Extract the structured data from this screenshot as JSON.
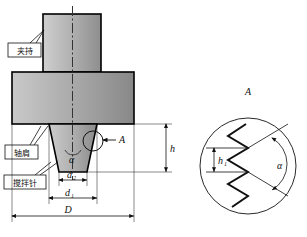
{
  "figure": {
    "title": "",
    "type": "engineering-cross-section-diagram"
  },
  "colors": {
    "outline": "#000000",
    "metal_light": "#d8d8d8",
    "metal_dark": "#8c8c8c",
    "centerline": "#333333",
    "dimension": "#111111",
    "background": "#ffffff"
  },
  "left_view": {
    "name": "tool-cross-section",
    "callout_labels": [
      {
        "id": "clamp",
        "text": "夹持",
        "meaning": "clamping-shank"
      },
      {
        "id": "shoulder",
        "text": "轴肩",
        "meaning": "shoulder"
      },
      {
        "id": "pin",
        "text": "搅拌针",
        "meaning": "stirring-pin"
      }
    ],
    "dimensions": [
      {
        "id": "d2",
        "symbol": "d",
        "subscript": "2",
        "meaning": "pin-tip-diameter"
      },
      {
        "id": "d1",
        "symbol": "d",
        "subscript": "1",
        "meaning": "pin-root-diameter"
      },
      {
        "id": "D",
        "symbol": "D",
        "subscript": "",
        "meaning": "shoulder-diameter"
      },
      {
        "id": "h",
        "symbol": "h",
        "subscript": "",
        "meaning": "pin-length"
      },
      {
        "id": "alpha",
        "symbol": "α",
        "subscript": "",
        "meaning": "pin-taper-angle"
      }
    ],
    "detail_marker": {
      "id": "A",
      "text": "A"
    }
  },
  "right_view": {
    "name": "detail-view-A",
    "title": "A",
    "dimensions": [
      {
        "id": "h1",
        "symbol": "h",
        "subscript": "1",
        "meaning": "thread-pitch-height"
      },
      {
        "id": "alpha",
        "symbol": "α",
        "subscript": "",
        "meaning": "thread-included-angle"
      }
    ]
  }
}
